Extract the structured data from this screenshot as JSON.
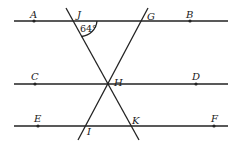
{
  "diagram": {
    "lines": {
      "AB": {
        "x1": 14,
        "y1": 21,
        "x2": 228,
        "y2": 21
      },
      "CD": {
        "x1": 14,
        "y1": 84,
        "x2": 228,
        "y2": 84
      },
      "EF": {
        "x1": 14,
        "y1": 126,
        "x2": 228,
        "y2": 126
      },
      "JK": {
        "x1": 66,
        "y1": 8,
        "x2": 139,
        "y2": 140
      },
      "GI": {
        "x1": 148,
        "y1": 8,
        "x2": 78,
        "y2": 140
      }
    },
    "points": {
      "A": {
        "label": "A",
        "x": 34,
        "y": 21,
        "lx": 30,
        "ly": 18,
        "dot": true
      },
      "B": {
        "label": "B",
        "x": 190,
        "y": 21,
        "lx": 186,
        "ly": 18,
        "dot": true
      },
      "C": {
        "label": "C",
        "x": 35,
        "y": 84,
        "lx": 31,
        "ly": 80,
        "dot": true
      },
      "D": {
        "label": "D",
        "x": 196,
        "y": 84,
        "lx": 192,
        "ly": 80,
        "dot": true
      },
      "E": {
        "label": "E",
        "x": 38,
        "y": 126,
        "lx": 34,
        "ly": 122,
        "dot": true
      },
      "F": {
        "label": "F",
        "x": 214,
        "y": 126,
        "lx": 211,
        "ly": 122,
        "dot": true
      },
      "J": {
        "label": "J",
        "x": 73,
        "y": 21,
        "lx": 77,
        "ly": 18,
        "dot": false
      },
      "G": {
        "label": "G",
        "x": 143,
        "y": 21,
        "lx": 147,
        "ly": 20,
        "dot": false
      },
      "H": {
        "label": "H",
        "x": 108,
        "y": 84,
        "lx": 114,
        "ly": 86,
        "dot": false
      },
      "I": {
        "label": "I",
        "x": 87,
        "y": 126,
        "lx": 87,
        "ly": 135,
        "dot": false
      },
      "K": {
        "label": "K",
        "x": 130,
        "y": 126,
        "lx": 132,
        "ly": 124,
        "dot": false
      }
    },
    "angle": {
      "label": "64°",
      "vertex": "J",
      "arc_path": "M 81.5 36.5 A 17 17 0 0 0 97 21",
      "lx": 80,
      "ly": 32
    }
  }
}
